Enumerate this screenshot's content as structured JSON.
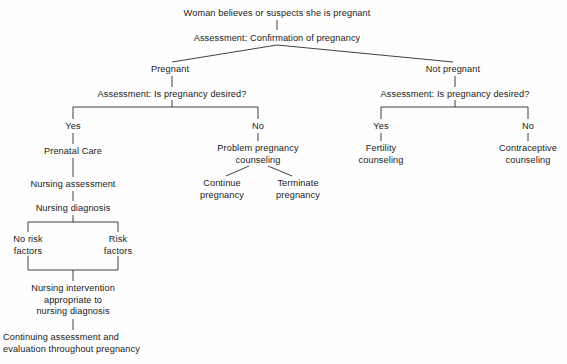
{
  "diagram": {
    "type": "flowchart",
    "line_color": "#2b2b2b",
    "text_color": "#1a1a1a",
    "background_color": "#fefefe",
    "nodes": [
      {
        "id": "root",
        "text": "Woman believes or suspects she is pregnant",
        "x": 277,
        "y": 8,
        "align": "center"
      },
      {
        "id": "assess1",
        "text": "Assessment: Confirmation of pregnancy",
        "x": 277,
        "y": 33,
        "align": "center"
      },
      {
        "id": "pregnant",
        "text": "Pregnant",
        "x": 170,
        "y": 64,
        "align": "center"
      },
      {
        "id": "not-pregnant",
        "text": "Not pregnant",
        "x": 453,
        "y": 64,
        "align": "center"
      },
      {
        "id": "assess2-left",
        "text": "Assessment: Is pregnancy desired?",
        "x": 172,
        "y": 89,
        "align": "center"
      },
      {
        "id": "assess2-right",
        "text": "Assessment: Is pregnancy desired?",
        "x": 455,
        "y": 89,
        "align": "center"
      },
      {
        "id": "yes-left",
        "text": "Yes",
        "x": 73,
        "y": 121,
        "align": "center"
      },
      {
        "id": "no-left",
        "text": "No",
        "x": 258,
        "y": 121,
        "align": "center"
      },
      {
        "id": "yes-right",
        "text": "Yes",
        "x": 381,
        "y": 121,
        "align": "center"
      },
      {
        "id": "no-right",
        "text": "No",
        "x": 528,
        "y": 121,
        "align": "center"
      },
      {
        "id": "prenatal",
        "text": "Prenatal Care",
        "x": 73,
        "y": 146,
        "align": "center"
      },
      {
        "id": "problem-preg",
        "text": "Problem pregnancy\ncounseling",
        "x": 258,
        "y": 143,
        "align": "center"
      },
      {
        "id": "fertility",
        "text": "Fertility\ncounseling",
        "x": 381,
        "y": 143,
        "align": "center"
      },
      {
        "id": "contraceptive",
        "text": "Contraceptive\ncounseling",
        "x": 528,
        "y": 143,
        "align": "center"
      },
      {
        "id": "nursing-assess",
        "text": "Nursing assessment",
        "x": 73,
        "y": 179,
        "align": "center"
      },
      {
        "id": "continue-preg",
        "text": "Continue\npregnancy",
        "x": 222,
        "y": 178,
        "align": "center"
      },
      {
        "id": "terminate-preg",
        "text": "Terminate\npregnancy",
        "x": 298,
        "y": 178,
        "align": "center"
      },
      {
        "id": "nursing-diag",
        "text": "Nursing diagnosis",
        "x": 73,
        "y": 203,
        "align": "center"
      },
      {
        "id": "no-risk",
        "text": "No risk\nfactors",
        "x": 28,
        "y": 234,
        "align": "center"
      },
      {
        "id": "risk",
        "text": "Risk\nfactors",
        "x": 118,
        "y": 234,
        "align": "center"
      },
      {
        "id": "intervention",
        "text": "Nursing intervention\nappropriate to\nnursing diagnosis",
        "x": 73,
        "y": 283,
        "align": "center"
      },
      {
        "id": "continuing",
        "text": "Continuing assessment and\nevaluation throughout pregnancy",
        "x": 3,
        "y": 332,
        "align": "left"
      }
    ],
    "edges": [
      {
        "from": "root",
        "to": "assess1",
        "kind": "vertical"
      },
      {
        "from": "assess1",
        "to": "pregnant",
        "kind": "diagonal"
      },
      {
        "from": "assess1",
        "to": "not-pregnant",
        "kind": "diagonal"
      },
      {
        "from": "pregnant",
        "to": "assess2-left",
        "kind": "vertical"
      },
      {
        "from": "not-pregnant",
        "to": "assess2-right",
        "kind": "vertical"
      },
      {
        "from": "assess2-left",
        "to": "yes-left",
        "kind": "bracket"
      },
      {
        "from": "assess2-left",
        "to": "no-left",
        "kind": "bracket"
      },
      {
        "from": "assess2-right",
        "to": "yes-right",
        "kind": "bracket"
      },
      {
        "from": "assess2-right",
        "to": "no-right",
        "kind": "bracket"
      },
      {
        "from": "yes-left",
        "to": "prenatal",
        "kind": "vertical"
      },
      {
        "from": "no-left",
        "to": "problem-preg",
        "kind": "vertical"
      },
      {
        "from": "yes-right",
        "to": "fertility",
        "kind": "vertical"
      },
      {
        "from": "no-right",
        "to": "contraceptive",
        "kind": "vertical"
      },
      {
        "from": "prenatal",
        "to": "nursing-assess",
        "kind": "vertical"
      },
      {
        "from": "problem-preg",
        "to": "continue-preg",
        "kind": "diagonal"
      },
      {
        "from": "problem-preg",
        "to": "terminate-preg",
        "kind": "diagonal"
      },
      {
        "from": "nursing-assess",
        "to": "nursing-diag",
        "kind": "vertical"
      },
      {
        "from": "nursing-diag",
        "to": "no-risk",
        "kind": "bracket"
      },
      {
        "from": "nursing-diag",
        "to": "risk",
        "kind": "bracket"
      },
      {
        "from": "no-risk",
        "to": "intervention",
        "kind": "merge"
      },
      {
        "from": "risk",
        "to": "intervention",
        "kind": "merge"
      },
      {
        "from": "intervention",
        "to": "continuing",
        "kind": "vertical"
      }
    ]
  }
}
